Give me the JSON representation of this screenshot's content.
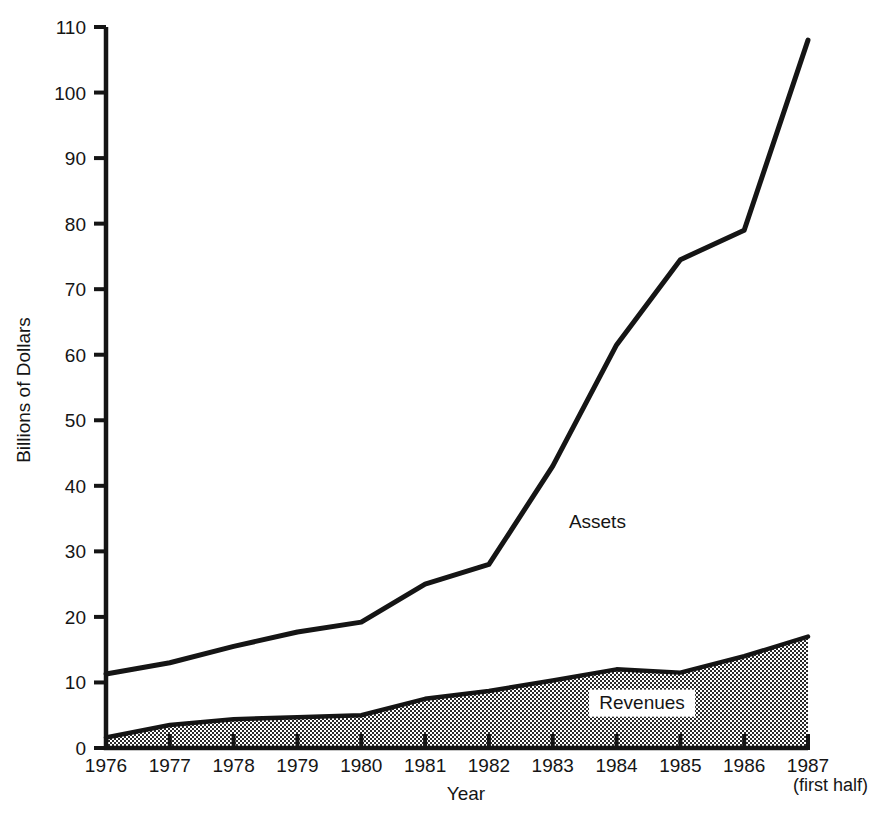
{
  "chart_data": {
    "type": "area",
    "title": "",
    "xlabel": "Year",
    "ylabel": "Billions of Dollars",
    "categories": [
      "1976",
      "1977",
      "1978",
      "1979",
      "1980",
      "1981",
      "1982",
      "1983",
      "1984",
      "1985",
      "1986",
      "1987"
    ],
    "x": [
      1976,
      1977,
      1978,
      1979,
      1980,
      1981,
      1982,
      1983,
      1984,
      1985,
      1986,
      1987
    ],
    "xlim": [
      1976,
      1987
    ],
    "ylim": [
      0,
      110
    ],
    "yticks": [
      0,
      10,
      20,
      30,
      40,
      50,
      60,
      70,
      80,
      90,
      100,
      110
    ],
    "ytick_labels": [
      "0",
      "10",
      "20",
      "30",
      "40",
      "50",
      "60",
      "70",
      "80",
      "90",
      "100",
      "110"
    ],
    "grid": false,
    "legend_position": "inline-annotation",
    "last_category_note": "(first half)",
    "series": [
      {
        "name": "Assets",
        "style": "line",
        "color": "#151515",
        "values": [
          11.3,
          13.0,
          15.5,
          17.7,
          19.2,
          25.0,
          28.0,
          43.0,
          61.5,
          74.5,
          79.0,
          108.0
        ]
      },
      {
        "name": "Revenues",
        "style": "filled-area",
        "color": "#151515",
        "fill": "checker-gray",
        "values": [
          1.6,
          3.5,
          4.4,
          4.7,
          5.0,
          7.5,
          8.7,
          10.3,
          12.0,
          11.5,
          14.0,
          17.0
        ]
      }
    ],
    "annotations": [
      {
        "text": "Assets",
        "x": 1983.7,
        "y": 33.5,
        "boxed": false
      },
      {
        "text": "Revenues",
        "x": 1984.4,
        "y": 6.0,
        "boxed": true
      }
    ]
  },
  "axes": {
    "y_axis_title": "Billions of Dollars",
    "x_axis_title": "Year"
  }
}
